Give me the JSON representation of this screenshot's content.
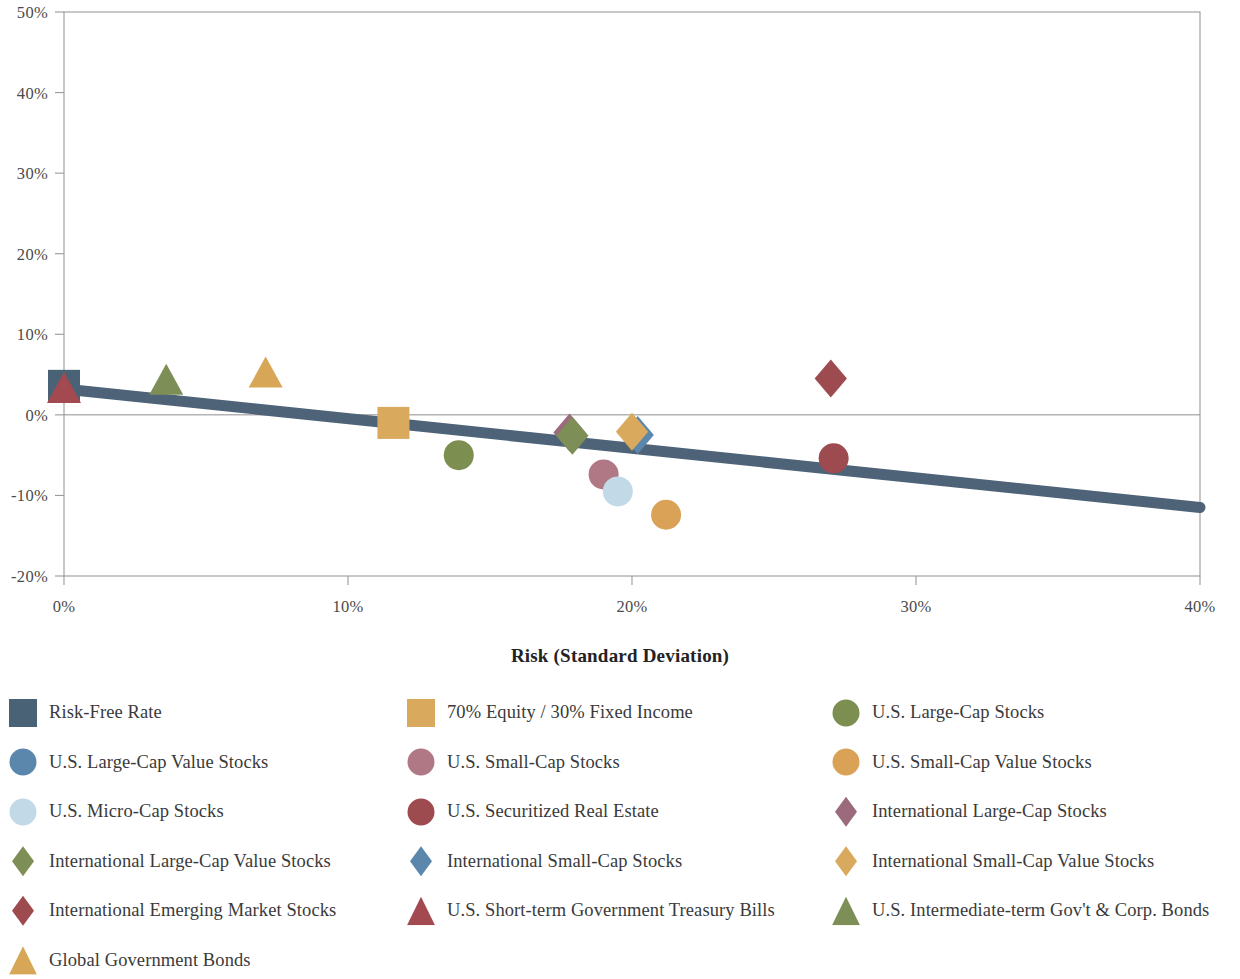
{
  "chart_data": {
    "type": "scatter",
    "title": "",
    "xlabel": "Risk (Standard Deviation)",
    "ylabel": "",
    "xlim": [
      0,
      40
    ],
    "ylim": [
      -20,
      50
    ],
    "xticks": [
      "0%",
      "10%",
      "20%",
      "30%",
      "40%"
    ],
    "xtick_values": [
      0,
      10,
      20,
      30,
      40
    ],
    "yticks": [
      "50%",
      "40%",
      "30%",
      "20%",
      "10%",
      "0%",
      "-10%",
      "-20%"
    ],
    "ytick_values": [
      50,
      40,
      30,
      20,
      10,
      0,
      -10,
      -20
    ],
    "grid": false,
    "zero_line": true,
    "legend_position": "bottom",
    "trendline": {
      "name": "trendline",
      "color": "#4e6377",
      "x0": 0,
      "y0": 3.2,
      "x1": 40,
      "y1": -11.5,
      "width_px": 11
    },
    "points": [
      {
        "label": "Risk-Free Rate",
        "marker": "square",
        "color": "#4a6275",
        "x": 0.0,
        "y": 3.6
      },
      {
        "label": "U.S. Short-term Government Treasury Bills",
        "marker": "triangle",
        "color": "#a34a50",
        "x": 0.0,
        "y": 3.1
      },
      {
        "label": "U.S. Intermediate-term Gov't & Corp. Bonds",
        "marker": "triangle",
        "color": "#7d8f56",
        "x": 3.6,
        "y": 4.1
      },
      {
        "label": "Global Government Bonds",
        "marker": "triangle",
        "color": "#d7a757",
        "x": 7.1,
        "y": 5.0
      },
      {
        "label": "70% Equity / 30% Fixed Income",
        "marker": "square",
        "color": "#d9a95e",
        "x": 11.6,
        "y": -1.0
      },
      {
        "label": "U.S. Large-Cap Stocks",
        "marker": "circle",
        "color": "#7d8f50",
        "x": 13.9,
        "y": -5.0
      },
      {
        "label": "International Large-Cap Stocks",
        "marker": "diamond",
        "color": "#9b6a7d",
        "x": 17.8,
        "y": -2.2
      },
      {
        "label": "International Large-Cap Value Stocks",
        "marker": "diamond",
        "color": "#7d8f56",
        "x": 17.9,
        "y": -2.6
      },
      {
        "label": "U.S. Small-Cap Stocks",
        "marker": "circle",
        "color": "#b07885",
        "x": 19.0,
        "y": -7.4
      },
      {
        "label": "U.S. Micro-Cap Stocks",
        "marker": "circle",
        "color": "#c2d9e8",
        "x": 19.5,
        "y": -9.5
      },
      {
        "label": "International Small-Cap Stocks",
        "marker": "diamond",
        "color": "#5b87ac",
        "x": 20.2,
        "y": -2.5
      },
      {
        "label": "International Small-Cap Value Stocks",
        "marker": "diamond",
        "color": "#d9a95e",
        "x": 20.0,
        "y": -2.1
      },
      {
        "label": "U.S. Small-Cap Value Stocks",
        "marker": "circle",
        "color": "#d9a257",
        "x": 21.2,
        "y": -12.4
      },
      {
        "label": "International Emerging Market Stocks",
        "marker": "diamond",
        "color": "#9e4b50",
        "x": 27.0,
        "y": 4.5
      },
      {
        "label": "U.S. Securitized Real Estate",
        "marker": "circle",
        "color": "#9e4b50",
        "x": 27.1,
        "y": -5.4
      }
    ]
  },
  "axis": {
    "x_title": "Risk (Standard Deviation)",
    "x_ticks": [
      "0%",
      "10%",
      "20%",
      "30%",
      "40%"
    ],
    "y_ticks": [
      "50%",
      "40%",
      "30%",
      "20%",
      "10%",
      "0%",
      "-10%",
      "-20%"
    ]
  },
  "legend": {
    "rows": [
      [
        {
          "label": "Risk-Free Rate",
          "marker": "square",
          "color": "#4a6275"
        },
        {
          "label": "70% Equity / 30% Fixed Income",
          "marker": "square",
          "color": "#d9a95e"
        },
        {
          "label": "U.S. Large-Cap Stocks",
          "marker": "circle",
          "color": "#7d8f50"
        }
      ],
      [
        {
          "label": "U.S. Large-Cap Value Stocks",
          "marker": "circle",
          "color": "#5b87ac"
        },
        {
          "label": "U.S. Small-Cap Stocks",
          "marker": "circle",
          "color": "#b07885"
        },
        {
          "label": "U.S. Small-Cap Value Stocks",
          "marker": "circle",
          "color": "#d9a257"
        }
      ],
      [
        {
          "label": "U.S. Micro-Cap Stocks",
          "marker": "circle",
          "color": "#c2d9e8"
        },
        {
          "label": "U.S. Securitized Real Estate",
          "marker": "circle",
          "color": "#9e4b50"
        },
        {
          "label": "International Large-Cap Stocks",
          "marker": "diamond",
          "color": "#9b6a7d"
        }
      ],
      [
        {
          "label": "International Large-Cap Value Stocks",
          "marker": "diamond",
          "color": "#7d8f56"
        },
        {
          "label": "International Small-Cap Stocks",
          "marker": "diamond",
          "color": "#5b87ac"
        },
        {
          "label": "International Small-Cap Value Stocks",
          "marker": "diamond",
          "color": "#d9a95e"
        }
      ],
      [
        {
          "label": "International Emerging Market Stocks",
          "marker": "diamond",
          "color": "#9e4b50"
        },
        {
          "label": "U.S. Short-term Government Treasury Bills",
          "marker": "triangle",
          "color": "#a34a50"
        },
        {
          "label": "U.S. Intermediate-term Gov't & Corp. Bonds",
          "marker": "triangle",
          "color": "#7d8f56"
        }
      ],
      [
        {
          "label": "Global Government Bonds",
          "marker": "triangle",
          "color": "#d7a757"
        }
      ]
    ]
  },
  "colors": {
    "axis_line": "#9a9a9a",
    "zero_line": "#8d8d8d",
    "trendline": "#4e6377",
    "text": "#3a3a3a"
  }
}
